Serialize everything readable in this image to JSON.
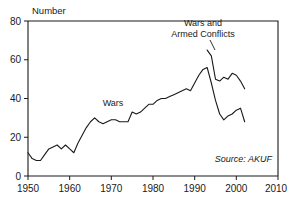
{
  "chart_data": {
    "type": "line",
    "title": "",
    "ylabel": "Number",
    "xlabel": "",
    "xlim": [
      1950,
      2010
    ],
    "ylim": [
      0,
      80
    ],
    "grid": false,
    "legend_position": "inline-annotations",
    "xticks": [
      1950,
      1960,
      1970,
      1980,
      1990,
      2000,
      2010
    ],
    "yticks": [
      0,
      20,
      40,
      60,
      80
    ],
    "source": "Source: AKUF",
    "annotations": [
      {
        "text_line1": "Wars and",
        "text_line2": "Armed Conflicts",
        "points_to_series": "Wars and Armed Conflicts"
      },
      {
        "text_line1": "Wars",
        "text_line2": "",
        "points_to_series": "Wars"
      }
    ],
    "series": [
      {
        "name": "Wars",
        "x": [
          1950,
          1951,
          1952,
          1953,
          1954,
          1955,
          1956,
          1957,
          1958,
          1959,
          1960,
          1961,
          1962,
          1963,
          1964,
          1965,
          1966,
          1967,
          1968,
          1969,
          1970,
          1971,
          1972,
          1973,
          1974,
          1975,
          1976,
          1977,
          1978,
          1979,
          1980,
          1981,
          1982,
          1983,
          1984,
          1985,
          1986,
          1987,
          1988,
          1989,
          1990,
          1991,
          1992,
          1993,
          1994,
          1995,
          1996,
          1997,
          1998,
          1999,
          2000,
          2001,
          2002
        ],
        "values": [
          12,
          9,
          8,
          8,
          11,
          14,
          15,
          16,
          14,
          16,
          14,
          12,
          17,
          21,
          25,
          28,
          30,
          28,
          27,
          28,
          29,
          29,
          28,
          28,
          28,
          33,
          32,
          33,
          35,
          37,
          37,
          39,
          40,
          40,
          41,
          42,
          43,
          44,
          45,
          44,
          48,
          52,
          55,
          56,
          48,
          39,
          32,
          29,
          31,
          32,
          34,
          35,
          28
        ]
      },
      {
        "name": "Wars and Armed Conflicts",
        "x": [
          1993,
          1994,
          1995,
          1996,
          1997,
          1998,
          1999,
          2000,
          2001,
          2002
        ],
        "values": [
          65,
          62,
          50,
          49,
          51,
          50,
          53,
          52,
          49,
          45
        ]
      }
    ]
  }
}
